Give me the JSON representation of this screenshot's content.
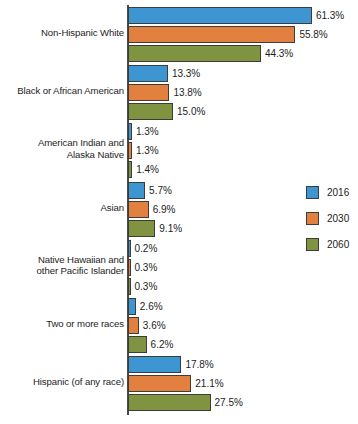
{
  "chart_data": {
    "type": "bar",
    "orientation": "horizontal",
    "title": "",
    "xlabel": "",
    "ylabel": "",
    "xlim": [
      0,
      61.3
    ],
    "grid": false,
    "legend_position": "right",
    "categories": [
      "Non-Hispanic White",
      "Black or African American",
      "American Indian and\nAlaska Native",
      "Asian",
      "Native Hawaiian and\nother Pacific Islander",
      "Two or more races",
      "Hispanic (of any race)"
    ],
    "series": [
      {
        "name": "2016",
        "color": "#3d95d1",
        "values": [
          61.3,
          13.3,
          1.3,
          5.7,
          0.2,
          2.6,
          17.8
        ]
      },
      {
        "name": "2030",
        "color": "#e2803f",
        "values": [
          55.8,
          13.8,
          1.3,
          6.9,
          0.3,
          3.6,
          21.1
        ]
      },
      {
        "name": "2060",
        "color": "#7f9340",
        "values": [
          44.3,
          15.0,
          1.4,
          9.1,
          0.3,
          6.2,
          27.5
        ]
      }
    ],
    "value_labels": [
      [
        "61.3%",
        "55.8%",
        "44.3%"
      ],
      [
        "13.3%",
        "13.8%",
        "15.0%"
      ],
      [
        "1.3%",
        "1.3%",
        "1.4%"
      ],
      [
        "5.7%",
        "6.9%",
        "9.1%"
      ],
      [
        "0.2%",
        "0.3%",
        "0.3%"
      ],
      [
        "2.6%",
        "3.6%",
        "6.2%"
      ],
      [
        "17.8%",
        "21.1%",
        "27.5%"
      ]
    ]
  },
  "legend": {
    "items": [
      {
        "label": "2016",
        "color": "#3d95d1"
      },
      {
        "label": "2030",
        "color": "#e2803f"
      },
      {
        "label": "2060",
        "color": "#7f9340"
      }
    ]
  },
  "category_labels": [
    {
      "line1": "Non-Hispanic White",
      "line2": ""
    },
    {
      "line1": "Black or African American",
      "line2": ""
    },
    {
      "line1": "American Indian and",
      "line2": "Alaska Native"
    },
    {
      "line1": "Asian",
      "line2": ""
    },
    {
      "line1": "Native Hawaiian and",
      "line2": "other Pacific Islander"
    },
    {
      "line1": "Two or more races",
      "line2": ""
    },
    {
      "line1": "Hispanic (of any race)",
      "line2": ""
    }
  ]
}
